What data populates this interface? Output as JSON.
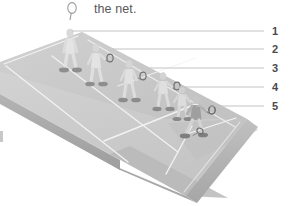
{
  "caption": {
    "icon": "racket-icon",
    "text": "the net."
  },
  "illustration": {
    "title": "badminton-court-perspective-illustration",
    "court": {
      "surface_color": "#c9c9c9",
      "surface_light_color": "#d4d4d4",
      "surface_shade_color": "#bcbcbc",
      "line_color": "#f2f2f2",
      "edge_color": "#a9a9a9",
      "edge_dark_color": "#9b9b9b"
    },
    "players": [
      {
        "id": "player-1",
        "shirt_color": "#e2e2e2",
        "has_racket": false
      },
      {
        "id": "player-2",
        "shirt_color": "#e2e2e2",
        "has_racket": true
      },
      {
        "id": "player-3",
        "shirt_color": "#e0e0e0",
        "has_racket": false
      },
      {
        "id": "player-4",
        "shirt_color": "#dedede",
        "has_racket": true
      },
      {
        "id": "player-5",
        "shirt_color": "#dcdcdc",
        "has_racket": true
      },
      {
        "id": "player-6",
        "shirt_color": "#a8a8a8",
        "has_racket": true
      }
    ]
  },
  "callouts": [
    {
      "number": "1",
      "line_y": 31,
      "line_x_start": 72,
      "label_x": 272,
      "label_y": 25
    },
    {
      "number": "2",
      "line_y": 49,
      "line_x_start": 112,
      "label_x": 272,
      "label_y": 43
    },
    {
      "number": "3",
      "line_y": 68,
      "line_x_start": 146,
      "label_x": 272,
      "label_y": 62
    },
    {
      "number": "4",
      "line_y": 87,
      "line_x_start": 178,
      "label_x": 272,
      "label_y": 81
    },
    {
      "number": "5",
      "line_y": 106,
      "line_x_start": 196,
      "label_x": 272,
      "label_y": 100
    }
  ],
  "colors": {
    "background": "#ffffff",
    "text": "#59595b",
    "number": "#4a4a4c",
    "leader_line": "#c3c3c3"
  }
}
